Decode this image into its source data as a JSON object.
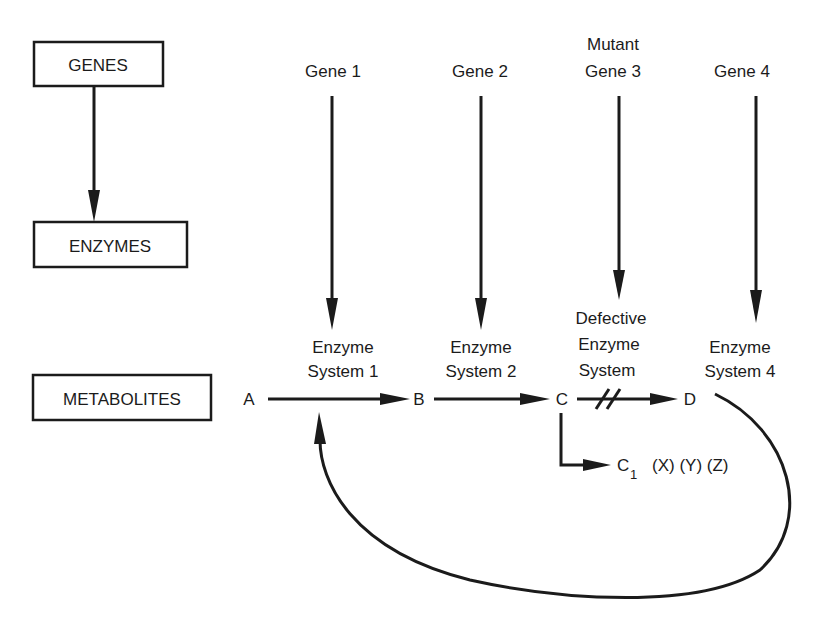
{
  "legend_boxes": {
    "genes": "GENES",
    "enzymes": "ENZYMES",
    "metabolites": "METABOLITES"
  },
  "genes": [
    {
      "line1": "",
      "line2": "Gene 1"
    },
    {
      "line1": "",
      "line2": "Gene 2"
    },
    {
      "line1": "Mutant",
      "line2": "Gene 3"
    },
    {
      "line1": "",
      "line2": "Gene 4"
    }
  ],
  "enzymes": [
    {
      "line1": "",
      "line2": "Enzyme",
      "line3": "System 1"
    },
    {
      "line1": "",
      "line2": "Enzyme",
      "line3": "System 2"
    },
    {
      "line1": "Defective",
      "line2": "Enzyme",
      "line3": "System"
    },
    {
      "line1": "",
      "line2": "Enzyme",
      "line3": "System 4"
    }
  ],
  "metabolites": {
    "a": "A",
    "b": "B",
    "c": "C",
    "d": "D",
    "c1_base": "C",
    "c1_sub": "1",
    "side_products": "(X) (Y) (Z)"
  }
}
